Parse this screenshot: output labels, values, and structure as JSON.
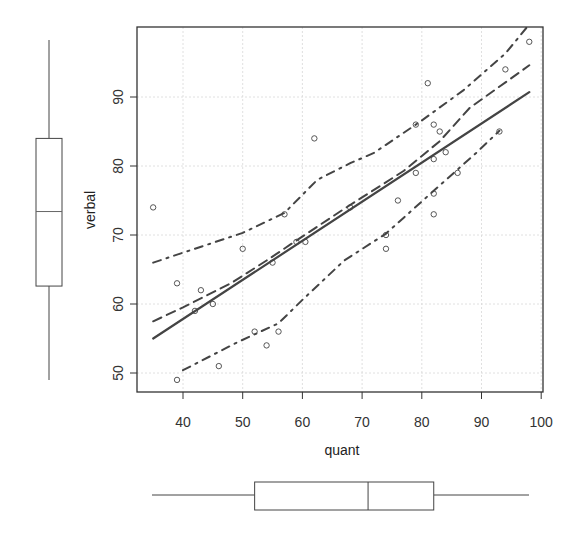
{
  "chart_data": {
    "type": "scatter",
    "title": "",
    "xlabel": "quant",
    "ylabel": "verbal",
    "xlim": [
      34,
      100
    ],
    "ylim": [
      48,
      100
    ],
    "xticks": [
      40,
      50,
      60,
      70,
      80,
      90,
      100
    ],
    "yticks": [
      50,
      60,
      70,
      80,
      90
    ],
    "grid": true,
    "points": [
      {
        "x": 35,
        "y": 74
      },
      {
        "x": 39,
        "y": 63
      },
      {
        "x": 43,
        "y": 62
      },
      {
        "x": 50,
        "y": 68
      },
      {
        "x": 42,
        "y": 59
      },
      {
        "x": 45,
        "y": 60
      },
      {
        "x": 52,
        "y": 56
      },
      {
        "x": 54,
        "y": 54
      },
      {
        "x": 46,
        "y": 51
      },
      {
        "x": 39,
        "y": 49
      },
      {
        "x": 62,
        "y": 84
      },
      {
        "x": 57,
        "y": 73
      },
      {
        "x": 59,
        "y": 69
      },
      {
        "x": 60.5,
        "y": 69
      },
      {
        "x": 55,
        "y": 66
      },
      {
        "x": 56,
        "y": 56
      },
      {
        "x": 68,
        "y": 74
      },
      {
        "x": 76,
        "y": 75
      },
      {
        "x": 74,
        "y": 70
      },
      {
        "x": 74,
        "y": 68
      },
      {
        "x": 98,
        "y": 98
      },
      {
        "x": 94,
        "y": 94
      },
      {
        "x": 81,
        "y": 92
      },
      {
        "x": 79,
        "y": 86
      },
      {
        "x": 82,
        "y": 86
      },
      {
        "x": 83,
        "y": 85
      },
      {
        "x": 93,
        "y": 85
      },
      {
        "x": 84,
        "y": 82
      },
      {
        "x": 82,
        "y": 81
      },
      {
        "x": 79,
        "y": 79
      },
      {
        "x": 86,
        "y": 79
      },
      {
        "x": 82,
        "y": 76
      },
      {
        "x": 82,
        "y": 73
      }
    ],
    "series": [
      {
        "name": "linear fit",
        "style": "solid",
        "points": [
          [
            35,
            55.0
          ],
          [
            98,
            90.7
          ]
        ]
      },
      {
        "name": "loess smooth",
        "style": "dashed",
        "points": [
          [
            35,
            57.5
          ],
          [
            40,
            59.5
          ],
          [
            48,
            63
          ],
          [
            54,
            66.3
          ],
          [
            59,
            69.2
          ],
          [
            67,
            73.8
          ],
          [
            77,
            79.3
          ],
          [
            83,
            83.6
          ],
          [
            88,
            88.4
          ],
          [
            98,
            94.6
          ]
        ]
      },
      {
        "name": "upper band",
        "style": "dotdash",
        "points": [
          [
            35,
            66
          ],
          [
            50,
            70.3
          ],
          [
            57,
            73.2
          ],
          [
            62.5,
            78
          ],
          [
            68,
            80.4
          ],
          [
            72,
            81.9
          ],
          [
            80,
            86.6
          ],
          [
            87,
            91
          ],
          [
            94,
            96.3
          ],
          [
            97.5,
            100
          ]
        ]
      },
      {
        "name": "lower band",
        "style": "dotdash",
        "points": [
          [
            40,
            50.4
          ],
          [
            49,
            54.4
          ],
          [
            56,
            57.2
          ],
          [
            60,
            60.6
          ],
          [
            67,
            66.3
          ],
          [
            74,
            70.2
          ],
          [
            82,
            76.4
          ],
          [
            89,
            81.8
          ],
          [
            93,
            85.1
          ]
        ]
      }
    ],
    "marginal_boxplots": {
      "verbal": {
        "whisker_low": 49,
        "q1": 62.6,
        "median": 73.4,
        "q3": 84,
        "whisker_high": 98
      },
      "quant": {
        "whisker_low": 35,
        "q1": 52,
        "median": 71,
        "q3": 82,
        "whisker_high": 98
      }
    }
  },
  "axes": {
    "xlabel": "quant",
    "ylabel": "verbal",
    "xtick_labels": [
      "40",
      "50",
      "60",
      "70",
      "80",
      "90",
      "100"
    ],
    "ytick_labels": [
      "50",
      "60",
      "70",
      "80",
      "90"
    ]
  }
}
